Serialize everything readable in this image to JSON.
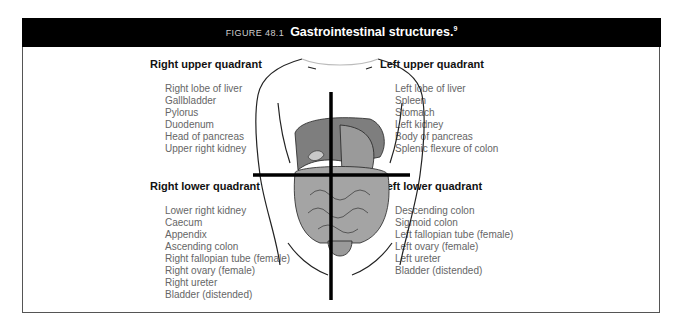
{
  "figure": {
    "label": "FIGURE 48.1",
    "title": "Gastrointestinal structures.",
    "reference": "9"
  },
  "quadrants": {
    "right_upper": {
      "heading": "Right upper quadrant",
      "items": [
        "Right lobe of liver",
        "Gallbladder",
        "Pylorus",
        "Duodenum",
        "Head of pancreas",
        "Upper right kidney"
      ]
    },
    "left_upper": {
      "heading": "Left upper quadrant",
      "items": [
        "Left lobe of liver",
        "Spleen",
        "Stomach",
        "Left kidney",
        "Body of pancreas",
        "Splenic flexure of colon"
      ]
    },
    "right_lower": {
      "heading": "Right lower quadrant",
      "items": [
        "Lower right kidney",
        "Caecum",
        "Appendix",
        "Ascending colon",
        "Right fallopian tube (female)",
        "Right ovary (female)",
        "Right ureter",
        "Bladder (distended)"
      ]
    },
    "left_lower": {
      "heading": "Left lower quadrant",
      "items": [
        "Descending colon",
        "Sigmoid colon",
        "Left fallopian tube (female)",
        "Left ovary (female)",
        "Left ureter",
        "Bladder (distended)"
      ]
    }
  },
  "illustration": {
    "subject": "torso-abdominal-organs-icon",
    "organ_fill": "#8a8a8a",
    "intestine_fill": "#a8a8a8"
  }
}
